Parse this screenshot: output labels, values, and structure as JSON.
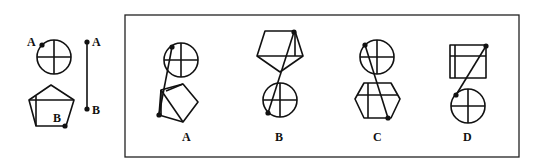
{
  "reference": {
    "point_a_label": "A",
    "point_b_label": "B",
    "segment_a_label": "A",
    "segment_b_label": "B",
    "shapes": [
      "circle-with-cross",
      "pentagon-with-lines"
    ]
  },
  "options": [
    {
      "label": "A",
      "top": "circle-with-cross",
      "bottom": "pentagon"
    },
    {
      "label": "B",
      "top": "pentagon",
      "bottom": "circle-with-cross"
    },
    {
      "label": "C",
      "top": "circle-with-cross",
      "bottom": "hexagon"
    },
    {
      "label": "D",
      "top": "rectangle-with-lines",
      "bottom": "circle-with-cross"
    }
  ],
  "colors": {
    "stroke": "#111111",
    "background": "#ffffff"
  }
}
